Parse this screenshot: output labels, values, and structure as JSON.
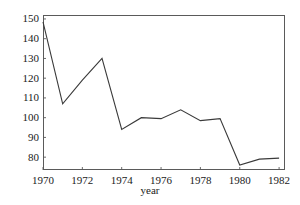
{
  "chart_data": {
    "type": "line",
    "title": "",
    "xlabel": "year",
    "ylabel": "",
    "x": [
      1970,
      1971,
      1972,
      1973,
      1974,
      1975,
      1976,
      1977,
      1978,
      1979,
      1980,
      1981,
      1982
    ],
    "values": [
      148.5,
      107.0,
      119.0,
      130.0,
      94.0,
      100.0,
      99.5,
      104.0,
      98.5,
      99.5,
      76.0,
      79.0,
      79.5
    ],
    "series": [
      {
        "name": "series-1",
        "values": [
          148.5,
          107.0,
          119.0,
          130.0,
          94.0,
          100.0,
          99.5,
          104.0,
          98.5,
          99.5,
          76.0,
          79.0,
          79.5
        ]
      }
    ],
    "xlim": [
      1970,
      1982.3
    ],
    "ylim": [
      73.5,
      152.0
    ],
    "xticks": [
      1970,
      1972,
      1974,
      1976,
      1978,
      1980,
      1982
    ],
    "xticklabels": [
      "1970",
      "1972",
      "1974",
      "1976",
      "1978",
      "1980",
      "1982"
    ],
    "yticks": [
      80,
      90,
      100,
      110,
      120,
      130,
      140,
      150
    ],
    "yticklabels": [
      "80",
      "90",
      "100",
      "110",
      "120",
      "130",
      "140",
      "150"
    ],
    "grid": false,
    "legend": null,
    "legend_position": "none",
    "line_color": "#3a3a3a",
    "frame_color": "#5a5a5a",
    "background_color": "#ffffff",
    "markers": false,
    "annotations": []
  }
}
